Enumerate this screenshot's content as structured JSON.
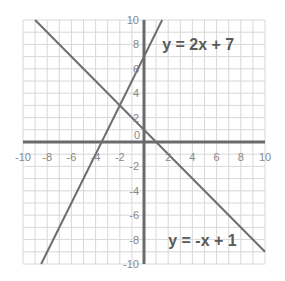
{
  "chart_data": {
    "type": "line",
    "title": "",
    "xlabel": "",
    "ylabel": "",
    "xlim": [
      -10,
      10
    ],
    "ylim": [
      -10,
      10
    ],
    "grid": true,
    "x_ticks": [
      -10,
      -8,
      -6,
      -4,
      -2,
      0,
      2,
      4,
      6,
      8,
      10
    ],
    "y_ticks": [
      -10,
      -8,
      -6,
      -4,
      -2,
      0,
      2,
      4,
      6,
      8,
      10
    ],
    "series": [
      {
        "name": "y = 2x + 7",
        "slope": 2,
        "intercept": 7,
        "x": [
          -8.5,
          1.5
        ],
        "y": [
          -10,
          10
        ]
      },
      {
        "name": "y = -x + 1",
        "slope": -1,
        "intercept": 1,
        "x": [
          -9,
          10
        ],
        "y": [
          10,
          -9
        ]
      }
    ],
    "annotations": [
      {
        "text": "y = 2x + 7",
        "x": 1.5,
        "y": 8
      },
      {
        "text": "y = -x + 1",
        "x": 2,
        "y": -8
      }
    ],
    "intersection": {
      "x": -2,
      "y": 3
    }
  },
  "colors": {
    "grid": "#d8d8d8",
    "axis": "#6a6a6a",
    "line": "#6e6e6e",
    "tick_label": "#888888",
    "equation_label": "#5a5a5a"
  }
}
